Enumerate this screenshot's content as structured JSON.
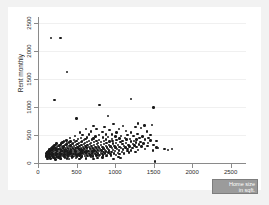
{
  "chart_data": {
    "type": "scatter",
    "title": "",
    "xlabel": "Home size in sqft.",
    "ylabel": "Rent monthly",
    "xlim": [
      0,
      2700
    ],
    "ylim": [
      0,
      2600
    ],
    "xticks": [
      0,
      500,
      1000,
      1500,
      2000,
      2500
    ],
    "yticks": [
      0,
      500,
      1000,
      1500,
      2000,
      2500
    ],
    "xtick_labels": [
      "0",
      "500",
      "1000",
      "1500",
      "2000",
      "2500"
    ],
    "ytick_labels": [
      "0",
      "500",
      "1000",
      "1500",
      "2000",
      "2500"
    ],
    "grid": true,
    "legend_position": "bottom-right",
    "legend_label_lines": [
      "Home size",
      "in sqft."
    ],
    "marker_color": "#1a1a1a",
    "background_color": "#f2f2f2",
    "canvas_color": "#ffffff",
    "axis_color": "#8a8a8a",
    "legend_fill": "#9b9b9b",
    "n_points": 338,
    "points": [
      [
        170,
        2230
      ],
      [
        290,
        2230
      ],
      [
        375,
        1625
      ],
      [
        215,
        1125
      ],
      [
        1210,
        1140
      ],
      [
        800,
        1030
      ],
      [
        1500,
        990
      ],
      [
        500,
        795
      ],
      [
        905,
        840
      ],
      [
        1480,
        680
      ],
      [
        1300,
        700
      ],
      [
        1380,
        665
      ],
      [
        1100,
        660
      ],
      [
        720,
        660
      ],
      [
        980,
        690
      ],
      [
        1265,
        640
      ],
      [
        1340,
        620
      ],
      [
        865,
        640
      ],
      [
        760,
        610
      ],
      [
        1050,
        610
      ],
      [
        620,
        600
      ],
      [
        930,
        585
      ],
      [
        1140,
        575
      ],
      [
        1415,
        560
      ],
      [
        1205,
        545
      ],
      [
        690,
        560
      ],
      [
        835,
        555
      ],
      [
        1020,
        540
      ],
      [
        545,
        540
      ],
      [
        1290,
        520
      ],
      [
        1460,
        500
      ],
      [
        1160,
        495
      ],
      [
        960,
        505
      ],
      [
        880,
        510
      ],
      [
        790,
        500
      ],
      [
        660,
        505
      ],
      [
        580,
        495
      ],
      [
        1080,
        485
      ],
      [
        1240,
        480
      ],
      [
        1355,
        470
      ],
      [
        480,
        480
      ],
      [
        1005,
        470
      ],
      [
        905,
        465
      ],
      [
        745,
        470
      ],
      [
        1435,
        450
      ],
      [
        1320,
        445
      ],
      [
        1130,
        450
      ],
      [
        640,
        455
      ],
      [
        560,
        450
      ],
      [
        840,
        455
      ],
      [
        415,
        440
      ],
      [
        1195,
        430
      ],
      [
        1060,
        435
      ],
      [
        960,
        430
      ],
      [
        720,
        435
      ],
      [
        615,
        430
      ],
      [
        520,
        425
      ],
      [
        1390,
        415
      ],
      [
        1280,
        420
      ],
      [
        1150,
        415
      ],
      [
        1020,
        410
      ],
      [
        880,
        415
      ],
      [
        790,
        410
      ],
      [
        700,
        415
      ],
      [
        600,
        405
      ],
      [
        470,
        410
      ],
      [
        370,
        400
      ],
      [
        1540,
        395
      ],
      [
        1460,
        400
      ],
      [
        1250,
        395
      ],
      [
        1095,
        390
      ],
      [
        965,
        395
      ],
      [
        855,
        390
      ],
      [
        760,
        395
      ],
      [
        665,
        390
      ],
      [
        575,
        385
      ],
      [
        500,
        390
      ],
      [
        420,
        385
      ],
      [
        340,
        380
      ],
      [
        1330,
        375
      ],
      [
        1205,
        380
      ],
      [
        1070,
        375
      ],
      [
        930,
        380
      ],
      [
        820,
        375
      ],
      [
        730,
        370
      ],
      [
        640,
        375
      ],
      [
        555,
        370
      ],
      [
        480,
        372
      ],
      [
        400,
        368
      ],
      [
        320,
        365
      ],
      [
        1430,
        360
      ],
      [
        1270,
        362
      ],
      [
        1140,
        358
      ],
      [
        1010,
        360
      ],
      [
        890,
        358
      ],
      [
        780,
        355
      ],
      [
        690,
        358
      ],
      [
        610,
        352
      ],
      [
        530,
        355
      ],
      [
        455,
        350
      ],
      [
        380,
        352
      ],
      [
        300,
        348
      ],
      [
        240,
        345
      ],
      [
        1370,
        345
      ],
      [
        1230,
        342
      ],
      [
        1095,
        340
      ],
      [
        970,
        345
      ],
      [
        860,
        340
      ],
      [
        765,
        338
      ],
      [
        675,
        340
      ],
      [
        595,
        335
      ],
      [
        515,
        338
      ],
      [
        445,
        335
      ],
      [
        370,
        332
      ],
      [
        295,
        330
      ],
      [
        230,
        328
      ],
      [
        1500,
        325
      ],
      [
        1310,
        328
      ],
      [
        1175,
        325
      ],
      [
        1040,
        322
      ],
      [
        925,
        325
      ],
      [
        820,
        320
      ],
      [
        730,
        322
      ],
      [
        645,
        318
      ],
      [
        565,
        320
      ],
      [
        490,
        318
      ],
      [
        420,
        315
      ],
      [
        350,
        318
      ],
      [
        280,
        312
      ],
      [
        215,
        315
      ],
      [
        1420,
        308
      ],
      [
        1255,
        310
      ],
      [
        1120,
        305
      ],
      [
        995,
        308
      ],
      [
        880,
        305
      ],
      [
        780,
        302
      ],
      [
        695,
        305
      ],
      [
        615,
        300
      ],
      [
        540,
        302
      ],
      [
        470,
        298
      ],
      [
        400,
        300
      ],
      [
        330,
        296
      ],
      [
        265,
        298
      ],
      [
        200,
        295
      ],
      [
        1345,
        292
      ],
      [
        1190,
        295
      ],
      [
        1060,
        290
      ],
      [
        940,
        292
      ],
      [
        835,
        288
      ],
      [
        745,
        290
      ],
      [
        660,
        286
      ],
      [
        585,
        288
      ],
      [
        515,
        285
      ],
      [
        445,
        287
      ],
      [
        380,
        283
      ],
      [
        315,
        285
      ],
      [
        250,
        282
      ],
      [
        190,
        280
      ],
      [
        1540,
        278
      ],
      [
        1280,
        280
      ],
      [
        1135,
        276
      ],
      [
        1005,
        278
      ],
      [
        895,
        275
      ],
      [
        795,
        276
      ],
      [
        710,
        272
      ],
      [
        630,
        275
      ],
      [
        555,
        272
      ],
      [
        485,
        270
      ],
      [
        415,
        272
      ],
      [
        350,
        268
      ],
      [
        288,
        270
      ],
      [
        228,
        266
      ],
      [
        175,
        268
      ],
      [
        1225,
        265
      ],
      [
        1080,
        262
      ],
      [
        960,
        264
      ],
      [
        850,
        260
      ],
      [
        760,
        262
      ],
      [
        675,
        258
      ],
      [
        598,
        260
      ],
      [
        525,
        257
      ],
      [
        455,
        258
      ],
      [
        390,
        255
      ],
      [
        325,
        257
      ],
      [
        265,
        253
      ],
      [
        208,
        255
      ],
      [
        165,
        252
      ],
      [
        1390,
        250
      ],
      [
        1160,
        248
      ],
      [
        1025,
        250
      ],
      [
        910,
        246
      ],
      [
        808,
        248
      ],
      [
        720,
        245
      ],
      [
        640,
        246
      ],
      [
        565,
        243
      ],
      [
        495,
        245
      ],
      [
        428,
        242
      ],
      [
        362,
        243
      ],
      [
        300,
        240
      ],
      [
        242,
        242
      ],
      [
        188,
        238
      ],
      [
        150,
        240
      ],
      [
        1300,
        236
      ],
      [
        1105,
        238
      ],
      [
        975,
        235
      ],
      [
        868,
        236
      ],
      [
        772,
        233
      ],
      [
        688,
        235
      ],
      [
        612,
        232
      ],
      [
        540,
        233
      ],
      [
        472,
        230
      ],
      [
        405,
        232
      ],
      [
        342,
        228
      ],
      [
        282,
        230
      ],
      [
        225,
        227
      ],
      [
        175,
        228
      ],
      [
        140,
        225
      ],
      [
        1490,
        225
      ],
      [
        1210,
        224
      ],
      [
        1050,
        222
      ],
      [
        925,
        224
      ],
      [
        825,
        220
      ],
      [
        735,
        222
      ],
      [
        655,
        218
      ],
      [
        580,
        220
      ],
      [
        510,
        217
      ],
      [
        445,
        218
      ],
      [
        382,
        215
      ],
      [
        320,
        217
      ],
      [
        262,
        213
      ],
      [
        208,
        215
      ],
      [
        160,
        212
      ],
      [
        130,
        214
      ],
      [
        1160,
        210
      ],
      [
        1000,
        212
      ],
      [
        885,
        208
      ],
      [
        790,
        210
      ],
      [
        705,
        207
      ],
      [
        628,
        208
      ],
      [
        555,
        205
      ],
      [
        488,
        207
      ],
      [
        422,
        203
      ],
      [
        360,
        205
      ],
      [
        300,
        202
      ],
      [
        245,
        203
      ],
      [
        195,
        200
      ],
      [
        152,
        202
      ],
      [
        122,
        198
      ],
      [
        1265,
        198
      ],
      [
        1090,
        196
      ],
      [
        955,
        198
      ],
      [
        850,
        195
      ],
      [
        758,
        196
      ],
      [
        676,
        193
      ],
      [
        602,
        195
      ],
      [
        532,
        192
      ],
      [
        465,
        193
      ],
      [
        402,
        190
      ],
      [
        342,
        192
      ],
      [
        285,
        188
      ],
      [
        232,
        190
      ],
      [
        182,
        187
      ],
      [
        142,
        188
      ],
      [
        115,
        185
      ],
      [
        1180,
        185
      ],
      [
        1035,
        183
      ],
      [
        915,
        185
      ],
      [
        818,
        182
      ],
      [
        730,
        183
      ],
      [
        650,
        180
      ],
      [
        578,
        182
      ],
      [
        510,
        178
      ],
      [
        445,
        180
      ],
      [
        385,
        177
      ],
      [
        325,
        178
      ],
      [
        270,
        175
      ],
      [
        218,
        177
      ],
      [
        172,
        174
      ],
      [
        135,
        175
      ],
      [
        108,
        172
      ],
      [
        1120,
        172
      ],
      [
        985,
        170
      ],
      [
        872,
        172
      ],
      [
        782,
        168
      ],
      [
        698,
        170
      ],
      [
        622,
        167
      ],
      [
        550,
        168
      ],
      [
        485,
        165
      ],
      [
        422,
        167
      ],
      [
        362,
        163
      ],
      [
        305,
        165
      ],
      [
        252,
        162
      ],
      [
        202,
        163
      ],
      [
        158,
        160
      ],
      [
        125,
        162
      ],
      [
        1060,
        158
      ],
      [
        940,
        160
      ],
      [
        835,
        157
      ],
      [
        748,
        158
      ],
      [
        668,
        155
      ],
      [
        595,
        157
      ],
      [
        525,
        153
      ],
      [
        462,
        155
      ],
      [
        402,
        152
      ],
      [
        345,
        153
      ],
      [
        290,
        150
      ],
      [
        238,
        152
      ],
      [
        190,
        148
      ],
      [
        148,
        150
      ],
      [
        118,
        147
      ],
      [
        1010,
        145
      ],
      [
        895,
        147
      ],
      [
        798,
        144
      ],
      [
        715,
        145
      ],
      [
        638,
        142
      ],
      [
        568,
        143
      ],
      [
        502,
        140
      ],
      [
        440,
        142
      ],
      [
        382,
        138
      ],
      [
        328,
        140
      ],
      [
        275,
        137
      ],
      [
        225,
        138
      ],
      [
        180,
        135
      ],
      [
        140,
        137
      ],
      [
        112,
        133
      ],
      [
        950,
        133
      ],
      [
        845,
        135
      ],
      [
        758,
        132
      ],
      [
        680,
        133
      ],
      [
        608,
        130
      ],
      [
        540,
        131
      ],
      [
        478,
        128
      ],
      [
        418,
        130
      ],
      [
        362,
        127
      ],
      [
        308,
        128
      ],
      [
        258,
        125
      ],
      [
        210,
        126
      ],
      [
        168,
        123
      ],
      [
        132,
        125
      ],
      [
        105,
        122
      ],
      [
        890,
        120
      ],
      [
        795,
        122
      ],
      [
        715,
        118
      ],
      [
        642,
        120
      ],
      [
        575,
        117
      ],
      [
        510,
        118
      ],
      [
        450,
        115
      ],
      [
        392,
        117
      ],
      [
        338,
        113
      ],
      [
        288,
        115
      ],
      [
        240,
        112
      ],
      [
        195,
        113
      ],
      [
        155,
        110
      ],
      [
        122,
        112
      ],
      [
        100,
        108
      ],
      [
        1045,
        105
      ],
      [
        835,
        100
      ],
      [
        690,
        102
      ],
      [
        560,
        98
      ],
      [
        445,
        100
      ],
      [
        348,
        96
      ],
      [
        268,
        98
      ],
      [
        200,
        95
      ],
      [
        150,
        96
      ],
      [
        115,
        93
      ],
      [
        1520,
        25
      ],
      [
        1070,
        85
      ],
      [
        770,
        88
      ],
      [
        620,
        82
      ],
      [
        490,
        85
      ],
      [
        380,
        80
      ],
      [
        290,
        82
      ],
      [
        218,
        78
      ],
      [
        162,
        80
      ],
      [
        125,
        76
      ],
      [
        1640,
        250
      ],
      [
        1740,
        248
      ],
      [
        1560,
        262
      ],
      [
        1690,
        230
      ],
      [
        980,
        72
      ],
      [
        720,
        68
      ],
      [
        540,
        70
      ],
      [
        400,
        66
      ],
      [
        300,
        68
      ],
      [
        225,
        64
      ]
    ]
  }
}
